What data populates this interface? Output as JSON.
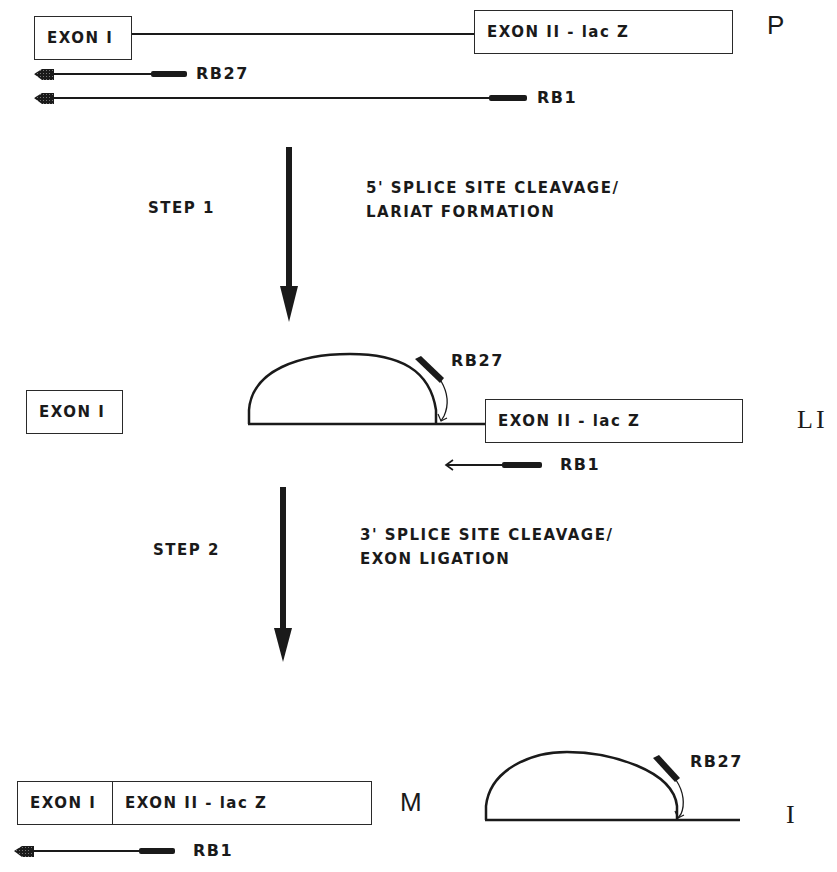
{
  "colors": {
    "line": "#1a1a1a",
    "background": "#ffffff"
  },
  "precursor": {
    "state_label": "P",
    "exon1": "EXON I",
    "exon2": "EXON II - lac Z",
    "probes": [
      {
        "name": "RB27"
      },
      {
        "name": "RB1"
      }
    ]
  },
  "step1": {
    "label": "STEP 1",
    "description_line1": "5' SPLICE SITE CLEAVAGE/",
    "description_line2": "LARIAT FORMATION"
  },
  "lariat_intermediate": {
    "state_label": "LI",
    "free_exon": "EXON I",
    "exon2": "EXON II - lac Z",
    "probe_lariat": "RB27",
    "probe_exon": "RB1"
  },
  "step2": {
    "label": "STEP 2",
    "description_line1": "3' SPLICE SITE CLEAVAGE/",
    "description_line2": "EXON LIGATION"
  },
  "mature": {
    "state_label": "M",
    "exon1": "EXON I",
    "exon2": "EXON II - lac Z",
    "probe": "RB1"
  },
  "intron_lariat": {
    "state_label": "I",
    "probe": "RB27"
  }
}
